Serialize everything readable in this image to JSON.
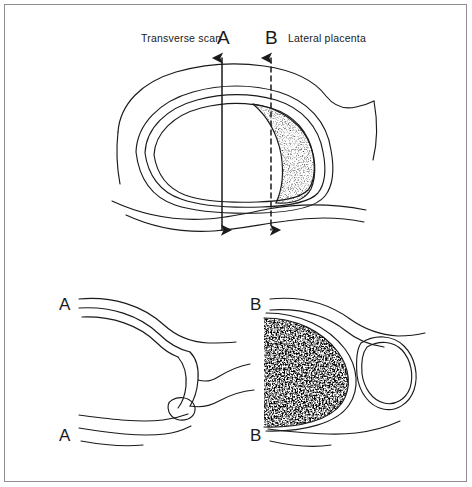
{
  "figure": {
    "background_color": "#ffffff",
    "ink_color": "#1a1a1a",
    "border_color": "#8d8d93"
  },
  "labels": {
    "transverse_scan": "Transverse scan",
    "lateral_placenta": "Lateral placenta",
    "plane_a": "A",
    "plane_b": "B",
    "section_a_top": "A",
    "section_a_bottom": "A",
    "section_b_top": "B",
    "section_b_bottom": "B"
  },
  "upper_panel": {
    "name": "transverse-section",
    "scan_line_a": {
      "style": "solid",
      "double_headed": true,
      "x": 222
    },
    "scan_line_b": {
      "style": "dashed",
      "double_headed": true,
      "x": 271
    },
    "placenta_position": "right lateral",
    "placenta_texture": "fine stipple"
  },
  "lower_left_panel": {
    "name": "scan-a-result",
    "placenta_visible": false,
    "texture": "none"
  },
  "lower_right_panel": {
    "name": "scan-b-result",
    "placenta_visible": true,
    "texture": "dense stipple"
  }
}
